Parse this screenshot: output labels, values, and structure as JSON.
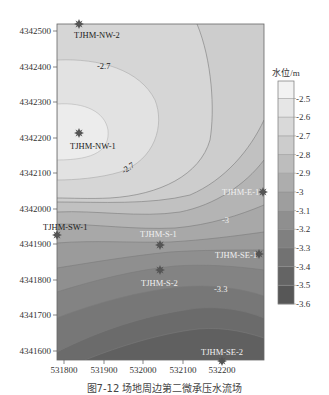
{
  "caption": "图7-12   场地周边第二微承压水流场",
  "colorbar": {
    "title": "水位/m",
    "ticks": [
      "-2.5",
      "-2.6",
      "-2.7",
      "-2.8",
      "-2.9",
      "-3",
      "-3.1",
      "-3.2",
      "-3.3",
      "-3.4",
      "-3.5",
      "-3.6"
    ],
    "colors": [
      "#f2f2f2",
      "#e6e6e6",
      "#d9d9d9",
      "#cccccc",
      "#bdbdbd",
      "#adadad",
      "#9e9e9e",
      "#8f8f8f",
      "#808080",
      "#727272",
      "#646464",
      "#575757"
    ]
  },
  "chart_data": {
    "type": "heatmap",
    "subtype": "filled-contour",
    "title": "图7-12 场地周边第二微承压水流场",
    "xlabel": "",
    "ylabel": "",
    "x_ticks": [
      531800,
      531900,
      532000,
      532100,
      532200
    ],
    "y_ticks": [
      4342500,
      4342400,
      4342300,
      4342200,
      4342100,
      4342000,
      4341900,
      4341800,
      4341700,
      4341600
    ],
    "xlim": [
      531780,
      532310
    ],
    "ylim": [
      4341575,
      4342520
    ],
    "colorbar_label": "水位/m",
    "colorbar_range": [
      -3.6,
      -2.5
    ],
    "contour_levels": [
      -2.5,
      -2.6,
      -2.7,
      -2.8,
      -2.9,
      -3.0,
      -3.1,
      -3.2,
      -3.3,
      -3.4,
      -3.5,
      -3.6
    ],
    "contour_labels": [
      {
        "value": "-2.7",
        "x": 531950,
        "y": 4342410
      },
      {
        "value": "-2.7",
        "x": 531960,
        "y": 4342135
      },
      {
        "value": "-3",
        "x": 532200,
        "y": 4341965
      },
      {
        "value": "-3.3",
        "x": 532195,
        "y": 4341745
      }
    ],
    "wells": [
      {
        "name": "TJHM-NW-2",
        "x": 531830,
        "y": 4342520
      },
      {
        "name": "TJHM-NW-1",
        "x": 531825,
        "y": 4342215
      },
      {
        "name": "TJHM-E-1",
        "x": 532300,
        "y": 4342050
      },
      {
        "name": "TJHM-SW-1",
        "x": 531780,
        "y": 4341930
      },
      {
        "name": "TJHM-S-1",
        "x": 532030,
        "y": 4341895
      },
      {
        "name": "TJHM-SE-1",
        "x": 532290,
        "y": 4341860
      },
      {
        "name": "TJHM-S-2",
        "x": 532030,
        "y": 4341815
      },
      {
        "name": "TJHM-SE-2",
        "x": 532200,
        "y": 4341575
      }
    ],
    "minimum_head_region": "southeast (~-3.6 m)",
    "maximum_head_region": "northwest near TJHM-NW-1 (~-2.5 m)"
  }
}
